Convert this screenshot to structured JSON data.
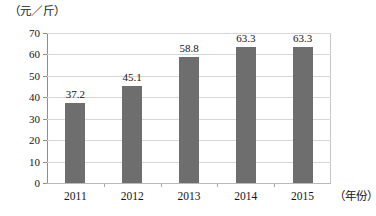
{
  "chart_data": {
    "type": "bar",
    "title": "",
    "subtitle": "",
    "xlabel": "（年份）",
    "ylabel": "（元／斤）",
    "categories": [
      "2011",
      "2012",
      "2013",
      "2014",
      "2015"
    ],
    "values": [
      37.2,
      45.1,
      58.8,
      63.3,
      63.3
    ],
    "value_labels": [
      "37.2",
      "45.1",
      "58.8",
      "63.3",
      "63.3"
    ],
    "ylim": [
      0,
      70
    ],
    "yticks": [
      0,
      10,
      20,
      30,
      40,
      50,
      60,
      70
    ],
    "ytick_labels": [
      "0",
      "10",
      "20",
      "30",
      "40",
      "50",
      "60",
      "70"
    ],
    "grid": "horizontal",
    "legend": "none",
    "series": [
      {
        "name": "价格",
        "values": [
          37.2,
          45.1,
          58.8,
          63.3,
          63.3
        ],
        "color": "#6e6e6e"
      }
    ],
    "colors": {
      "bar": "#6e6e6e",
      "gridline": "#d6d6d6",
      "axis": "#8d8d8d",
      "text": "#141414",
      "background": "#ffffff"
    }
  },
  "axis": {
    "unit_label": "（元／斤）",
    "x_axis_title": "（年份）"
  }
}
